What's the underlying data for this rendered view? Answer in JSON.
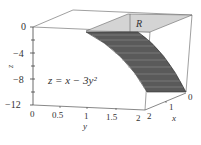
{
  "figure": {
    "equation": "z = x − 3y²",
    "region_label": "R",
    "z_axis": {
      "label": "z",
      "ticks": [
        "0",
        "−4",
        "−8",
        "−12"
      ]
    },
    "y_axis": {
      "label": "y",
      "ticks": [
        "0",
        "0.5",
        "1",
        "1.5",
        "2"
      ]
    },
    "x_axis": {
      "label": "x",
      "ticks": [
        "2",
        "1",
        "0"
      ]
    },
    "colors": {
      "surface": "#5a5a5a",
      "region": "#d4d4d4",
      "lines": "#555555"
    }
  }
}
